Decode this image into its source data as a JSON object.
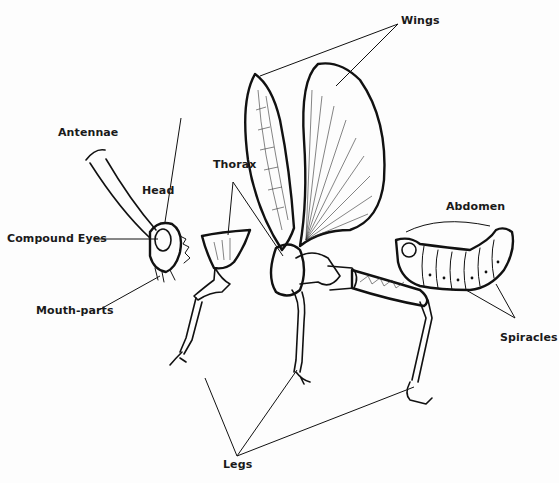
{
  "diagram": {
    "labels": {
      "wings": "Wings",
      "antennae": "Antennae",
      "head": "Head",
      "thorax": "Thorax",
      "abdomen": "Abdomen",
      "compound_eyes": "Compound Eyes",
      "mouth_parts": "Mouth-parts",
      "spiracles": "Spiracles",
      "legs": "Legs"
    },
    "colors": {
      "ink": "#111111",
      "background": "#fdfdfd"
    }
  }
}
